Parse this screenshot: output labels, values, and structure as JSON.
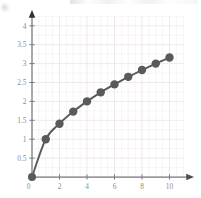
{
  "figure": {
    "name": "square-root-function-plot",
    "background_color": "#ffffff"
  },
  "chart_data": {
    "type": "scatter",
    "title": "",
    "subtitle": "",
    "xlabel": "",
    "ylabel": "",
    "xlim": [
      0,
      11.6
    ],
    "ylim": [
      0,
      4.35
    ],
    "grid": true,
    "grid_color": "#efe4e4",
    "grid_spacing_x": 0.5,
    "grid_spacing_y": 0.25,
    "legend": false,
    "legend_position": "none",
    "axis_color": "#7a7a80",
    "axis_arrows": true,
    "marker_color": "#59595e",
    "line_color": "#59595e",
    "marker_size": 4.2,
    "line_width": 1.9,
    "x": [
      0,
      1,
      2,
      3,
      4,
      5,
      6,
      7,
      8,
      9,
      10
    ],
    "y": [
      0,
      1,
      1.41,
      1.73,
      2,
      2.24,
      2.45,
      2.65,
      2.83,
      3,
      3.16
    ],
    "series": [
      {
        "name": "sqrt(x)",
        "values": [
          0,
          1,
          1.41,
          1.73,
          2,
          2.24,
          2.45,
          2.65,
          2.83,
          3,
          3.16
        ]
      }
    ],
    "xticks": [
      0,
      2,
      4,
      6,
      8,
      10
    ],
    "xtick_labels": [
      "0",
      "2",
      "4",
      "6",
      "8",
      "10"
    ],
    "yticks": [
      0,
      0.5,
      1,
      1.5,
      2,
      2.5,
      3,
      3.5,
      4
    ],
    "ytick_labels": [
      "0",
      "0.5",
      "1",
      "1.5",
      "2",
      "2.5",
      "3",
      "3.5",
      "4"
    ],
    "annotations": []
  },
  "axes": {
    "x_axis_name": "x-axis",
    "y_axis_name": "y-axis",
    "origin_label": "0"
  }
}
